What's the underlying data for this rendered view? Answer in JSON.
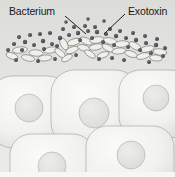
{
  "figure": {
    "kind": "biology-illustration",
    "width": 175,
    "height": 177
  },
  "labels": [
    {
      "id": "bacterium",
      "text": "Bacterium",
      "x": 9,
      "y": 5,
      "leader": {
        "x1": 65,
        "y1": 16,
        "x2": 86,
        "y2": 34
      }
    },
    {
      "id": "exotoxin",
      "text": "Exotoxin",
      "x": 128,
      "y": 5,
      "leader": {
        "x1": 125,
        "y1": 14,
        "x2": 104,
        "y2": 34
      }
    }
  ],
  "colors": {
    "background": "#e9e9e6",
    "background_top": "#dededa",
    "cell_fill": "#f3f3f1",
    "cell_edge": "#8d8d8a",
    "cell_shadow": "#cfcfcb",
    "nucleus_fill": "#e2e2de",
    "nucleus_edge": "#9a9a97",
    "bacterium_fill": "#efefec",
    "bacterium_edge": "#6e6e6b",
    "exotoxin_dot": "#4a4a52",
    "label_text": "#19191a",
    "leader_line": "#1e1e20",
    "bottom_strip": "#f7f7f6"
  },
  "epithelial_cells": [
    {
      "id": "cell-1",
      "cx": 30,
      "cy": 112,
      "rx": 40,
      "ry": 36,
      "nucleus": {
        "cx": 29,
        "cy": 108,
        "r": 14
      }
    },
    {
      "id": "cell-2",
      "cx": 95,
      "cy": 108,
      "rx": 44,
      "ry": 38,
      "nucleus": {
        "cx": 94,
        "cy": 113,
        "r": 15
      }
    },
    {
      "id": "cell-3",
      "cx": 155,
      "cy": 104,
      "rx": 36,
      "ry": 34,
      "nucleus": {
        "cx": 156,
        "cy": 98,
        "r": 13
      }
    },
    {
      "id": "cell-4",
      "cx": 52,
      "cy": 168,
      "rx": 42,
      "ry": 34,
      "nucleus": {
        "cx": 52,
        "cy": 166,
        "r": 14
      }
    },
    {
      "id": "cell-5",
      "cx": 130,
      "cy": 160,
      "rx": 44,
      "ry": 34,
      "nucleus": {
        "cx": 131,
        "cy": 155,
        "r": 14
      }
    }
  ],
  "bacteria": [
    {
      "cx": 20,
      "cy": 50,
      "rx": 7.5,
      "ry": 3.2,
      "rot": -6
    },
    {
      "cx": 36,
      "cy": 53,
      "rx": 7.0,
      "ry": 3.2,
      "rot": 4
    },
    {
      "cx": 51,
      "cy": 50,
      "rx": 7.5,
      "ry": 3.0,
      "rot": -10
    },
    {
      "cx": 64,
      "cy": 44,
      "rx": 6.5,
      "ry": 3.4,
      "rot": 62
    },
    {
      "cx": 74,
      "cy": 42,
      "rx": 7.0,
      "ry": 3.2,
      "rot": -18
    },
    {
      "cx": 86,
      "cy": 41,
      "rx": 6.8,
      "ry": 3.2,
      "rot": 24
    },
    {
      "cx": 97,
      "cy": 40,
      "rx": 7.2,
      "ry": 3.2,
      "rot": -8
    },
    {
      "cx": 110,
      "cy": 41,
      "rx": 7.0,
      "ry": 3.2,
      "rot": 12
    },
    {
      "cx": 122,
      "cy": 44,
      "rx": 7.4,
      "ry": 3.2,
      "rot": -4
    },
    {
      "cx": 135,
      "cy": 46,
      "rx": 6.6,
      "ry": 3.2,
      "rot": 30
    },
    {
      "cx": 147,
      "cy": 49,
      "rx": 7.2,
      "ry": 3.0,
      "rot": -12
    },
    {
      "cx": 160,
      "cy": 52,
      "rx": 6.8,
      "ry": 3.2,
      "rot": 8
    },
    {
      "cx": 28,
      "cy": 58,
      "rx": 6.8,
      "ry": 3.0,
      "rot": 14
    },
    {
      "cx": 45,
      "cy": 58,
      "rx": 7.0,
      "ry": 3.0,
      "rot": -6
    },
    {
      "cx": 60,
      "cy": 53,
      "rx": 6.4,
      "ry": 3.0,
      "rot": 40
    },
    {
      "cx": 72,
      "cy": 50,
      "rx": 6.8,
      "ry": 3.0,
      "rot": -22
    },
    {
      "cx": 84,
      "cy": 48,
      "rx": 6.6,
      "ry": 3.0,
      "rot": 16
    },
    {
      "cx": 96,
      "cy": 47,
      "rx": 7.0,
      "ry": 3.0,
      "rot": -10
    },
    {
      "cx": 108,
      "cy": 48,
      "rx": 6.6,
      "ry": 3.0,
      "rot": 28
    },
    {
      "cx": 119,
      "cy": 51,
      "rx": 7.0,
      "ry": 3.0,
      "rot": -6
    },
    {
      "cx": 131,
      "cy": 54,
      "rx": 6.6,
      "ry": 3.0,
      "rot": 18
    },
    {
      "cx": 143,
      "cy": 56,
      "rx": 6.8,
      "ry": 3.0,
      "rot": -14
    },
    {
      "cx": 156,
      "cy": 58,
      "rx": 6.4,
      "ry": 3.0,
      "rot": 6
    },
    {
      "cx": 12,
      "cy": 56,
      "rx": 6.2,
      "ry": 3.0,
      "rot": 20
    },
    {
      "cx": 67,
      "cy": 58,
      "rx": 6.0,
      "ry": 2.8,
      "rot": -30
    },
    {
      "cx": 90,
      "cy": 54,
      "rx": 6.2,
      "ry": 2.8,
      "rot": 34
    },
    {
      "cx": 103,
      "cy": 55,
      "rx": 6.2,
      "ry": 2.8,
      "rot": -20
    }
  ],
  "exotoxin_dots": [
    {
      "cx": 14,
      "cy": 44,
      "r": 2.1
    },
    {
      "cx": 25,
      "cy": 42,
      "r": 2.2
    },
    {
      "cx": 34,
      "cy": 45,
      "r": 2.0
    },
    {
      "cx": 43,
      "cy": 41,
      "r": 2.2
    },
    {
      "cx": 52,
      "cy": 44,
      "r": 2.0
    },
    {
      "cx": 60,
      "cy": 38,
      "r": 2.2
    },
    {
      "cx": 69,
      "cy": 35,
      "r": 2.1
    },
    {
      "cx": 78,
      "cy": 33,
      "r": 2.2
    },
    {
      "cx": 88,
      "cy": 31,
      "r": 2.0
    },
    {
      "cx": 97,
      "cy": 32,
      "r": 2.2
    },
    {
      "cx": 106,
      "cy": 34,
      "r": 2.1
    },
    {
      "cx": 116,
      "cy": 36,
      "r": 2.2
    },
    {
      "cx": 126,
      "cy": 38,
      "r": 2.0
    },
    {
      "cx": 136,
      "cy": 40,
      "r": 2.2
    },
    {
      "cx": 146,
      "cy": 43,
      "r": 2.1
    },
    {
      "cx": 156,
      "cy": 45,
      "r": 2.2
    },
    {
      "cx": 165,
      "cy": 48,
      "r": 2.0
    },
    {
      "cx": 19,
      "cy": 37,
      "r": 2.0
    },
    {
      "cx": 30,
      "cy": 35,
      "r": 2.1
    },
    {
      "cx": 40,
      "cy": 34,
      "r": 2.0
    },
    {
      "cx": 50,
      "cy": 33,
      "r": 2.1
    },
    {
      "cx": 63,
      "cy": 29,
      "r": 2.0
    },
    {
      "cx": 74,
      "cy": 27,
      "r": 2.1
    },
    {
      "cx": 85,
      "cy": 26,
      "r": 2.0
    },
    {
      "cx": 95,
      "cy": 27,
      "r": 2.0
    },
    {
      "cx": 110,
      "cy": 29,
      "r": 2.0
    },
    {
      "cx": 120,
      "cy": 31,
      "r": 2.0
    },
    {
      "cx": 133,
      "cy": 33,
      "r": 2.0
    },
    {
      "cx": 145,
      "cy": 36,
      "r": 2.0
    },
    {
      "cx": 157,
      "cy": 39,
      "r": 2.0
    },
    {
      "cx": 8,
      "cy": 50,
      "r": 2.0
    },
    {
      "cx": 22,
      "cy": 50,
      "r": 2.1
    },
    {
      "cx": 44,
      "cy": 49,
      "r": 2.0
    },
    {
      "cx": 57,
      "cy": 46,
      "r": 2.0
    },
    {
      "cx": 80,
      "cy": 40,
      "r": 2.0
    },
    {
      "cx": 92,
      "cy": 38,
      "r": 2.0
    },
    {
      "cx": 103,
      "cy": 42,
      "r": 2.1
    },
    {
      "cx": 114,
      "cy": 45,
      "r": 2.0
    },
    {
      "cx": 128,
      "cy": 47,
      "r": 2.0
    },
    {
      "cx": 140,
      "cy": 50,
      "r": 2.0
    },
    {
      "cx": 151,
      "cy": 53,
      "r": 2.0
    },
    {
      "cx": 163,
      "cy": 56,
      "r": 2.0
    },
    {
      "cx": 16,
      "cy": 60,
      "r": 2.0
    },
    {
      "cx": 38,
      "cy": 61,
      "r": 2.0
    },
    {
      "cx": 55,
      "cy": 59,
      "r": 1.9
    },
    {
      "cx": 76,
      "cy": 55,
      "r": 1.9
    },
    {
      "cx": 99,
      "cy": 59,
      "r": 2.0
    },
    {
      "cx": 112,
      "cy": 58,
      "r": 2.0
    },
    {
      "cx": 124,
      "cy": 60,
      "r": 2.0
    },
    {
      "cx": 149,
      "cy": 62,
      "r": 2.0
    },
    {
      "cx": 66,
      "cy": 22,
      "r": 1.8
    },
    {
      "cx": 104,
      "cy": 21,
      "r": 1.8
    },
    {
      "cx": 88,
      "cy": 19,
      "r": 1.7
    }
  ]
}
